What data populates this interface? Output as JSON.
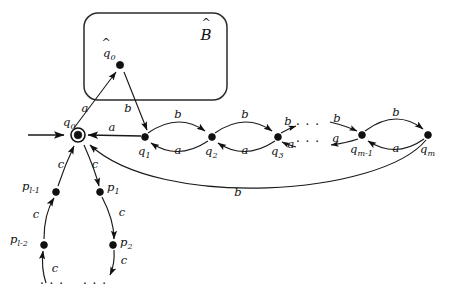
{
  "figure": {
    "kind": "finite-automaton-state-diagram",
    "background_color": "#ffffff",
    "ink_color": "#111111"
  },
  "box": {
    "label": "B",
    "label_accent": "hat",
    "label_style": "calligraphic",
    "x": 84,
    "y": 13,
    "width": 143,
    "height": 87,
    "corner_radius": 14
  },
  "states": {
    "q_hat_0": {
      "label": "q",
      "subscript": "0",
      "accent": "hat",
      "x": 120,
      "y": 65,
      "shape": "dot",
      "label_dx": -12,
      "label_dy": -10
    },
    "q0": {
      "label": "q",
      "subscript": "0",
      "accent": "none",
      "x": 78,
      "y": 135,
      "shape": "double-circle",
      "label_dx": -13,
      "label_dy": -12
    },
    "q1": {
      "label": "q",
      "subscript": "1",
      "accent": "none",
      "x": 145,
      "y": 137,
      "shape": "dot",
      "label_dx": -4,
      "label_dy": 16
    },
    "q2": {
      "label": "q",
      "subscript": "2",
      "accent": "none",
      "x": 212,
      "y": 137,
      "shape": "dot",
      "label_dx": -4,
      "label_dy": 16
    },
    "q3": {
      "label": "q",
      "subscript": "3",
      "accent": "none",
      "x": 278,
      "y": 137,
      "shape": "dot",
      "label_dx": -4,
      "label_dy": 16
    },
    "qm1": {
      "label": "q",
      "subscript": "m-1",
      "accent": "none",
      "x": 362,
      "y": 135,
      "shape": "dot",
      "label_dx": -10,
      "label_dy": 16
    },
    "qm": {
      "label": "q",
      "subscript": "m",
      "accent": "none",
      "x": 428,
      "y": 135,
      "shape": "dot",
      "label_dx": -4,
      "label_dy": 16
    },
    "p1": {
      "label": "p",
      "subscript": "1",
      "accent": "none",
      "x": 100,
      "y": 192,
      "shape": "dot",
      "label_dx": 6,
      "label_dy": 0
    },
    "p2": {
      "label": "p",
      "subscript": "2",
      "accent": "none",
      "x": 113,
      "y": 245,
      "shape": "dot",
      "label_dx": 6,
      "label_dy": 2
    },
    "pl2": {
      "label": "p",
      "subscript": "l-2",
      "accent": "none",
      "x": 44,
      "y": 245,
      "shape": "dot",
      "label_dx": -30,
      "label_dy": -2
    },
    "pl1": {
      "label": "p",
      "subscript": "l-1",
      "accent": "none",
      "x": 56,
      "y": 192,
      "shape": "dot",
      "label_dx": -30,
      "label_dy": -2
    }
  },
  "start_arrow": {
    "from_x": 28,
    "to_x": 66,
    "y": 135,
    "target": "q0"
  },
  "edges": [
    {
      "name": "q0-to-qhat0",
      "from": "q0",
      "to": "q_hat_0",
      "symbol": "a",
      "label_x": 85,
      "label_y": 112
    },
    {
      "name": "qhat0-to-q1",
      "from": "q_hat_0",
      "to": "q1",
      "symbol": "b",
      "label_x": 128,
      "label_y": 112
    },
    {
      "name": "q1-to-q0",
      "from": "q1",
      "to": "q0",
      "symbol": "a",
      "label_x": 112,
      "label_y": 131
    },
    {
      "name": "q1-to-q2",
      "from": "q1",
      "to": "q2",
      "symbol": "b",
      "label_x": 178,
      "label_y": 118
    },
    {
      "name": "q2-to-q1",
      "from": "q2",
      "to": "q1",
      "symbol": "a",
      "label_x": 178,
      "label_y": 152
    },
    {
      "name": "q2-to-q3",
      "from": "q2",
      "to": "q3",
      "symbol": "b",
      "label_x": 245,
      "label_y": 118
    },
    {
      "name": "q3-to-q2",
      "from": "q3",
      "to": "q2",
      "symbol": "a",
      "label_x": 245,
      "label_y": 152
    },
    {
      "name": "q3-to-next",
      "from": "q3",
      "to": "ellipsis",
      "symbol": "b",
      "label_x": 289,
      "label_y": 126
    },
    {
      "name": "next-to-q3",
      "from": "ellipsis",
      "to": "q3",
      "symbol": "a",
      "label_x": 292,
      "label_y": 146
    },
    {
      "name": "prev-to-qm1",
      "from": "ellipsis",
      "to": "qm1",
      "symbol": "b",
      "label_x": 337,
      "label_y": 124
    },
    {
      "name": "qm1-to-prev",
      "from": "qm1",
      "to": "ellipsis",
      "symbol": "a",
      "label_x": 335,
      "label_y": 143
    },
    {
      "name": "qm1-to-qm",
      "from": "qm1",
      "to": "qm",
      "symbol": "b",
      "label_x": 396,
      "label_y": 116
    },
    {
      "name": "qm-to-qm1",
      "from": "qm",
      "to": "qm1",
      "symbol": "a",
      "label_x": 396,
      "label_y": 150
    },
    {
      "name": "qm-to-q0",
      "from": "qm",
      "to": "q0",
      "symbol": "b",
      "label_x": 238,
      "label_y": 193
    },
    {
      "name": "q0-to-p1",
      "from": "q0",
      "to": "p1",
      "symbol": "c",
      "label_x": 95,
      "label_y": 167
    },
    {
      "name": "p1-to-p2",
      "from": "p1",
      "to": "p2",
      "symbol": "c",
      "label_x": 120,
      "label_y": 215
    },
    {
      "name": "p2-to-cycle",
      "from": "p2",
      "to": "ellipsis",
      "symbol": "c",
      "label_x": 122,
      "label_y": 263
    },
    {
      "name": "cycle-to-pl2",
      "from": "ellipsis",
      "to": "pl2",
      "symbol": "c",
      "label_x": 52,
      "label_y": 270
    },
    {
      "name": "pl2-to-pl1",
      "from": "pl2",
      "to": "pl1",
      "symbol": "c",
      "label_x": 38,
      "label_y": 217
    },
    {
      "name": "pl1-to-q0",
      "from": "pl1",
      "to": "q0",
      "symbol": "c",
      "label_x": 62,
      "label_y": 167
    }
  ],
  "ellipses": [
    {
      "name": "chain-ellipsis-upper",
      "text": "· · ·",
      "x": 308,
      "y": 126
    },
    {
      "name": "chain-ellipsis-lower",
      "text": "· · ·",
      "x": 308,
      "y": 143
    },
    {
      "name": "cycle-ellipsis-left",
      "text": "· · ·",
      "x": 52,
      "y": 285
    },
    {
      "name": "cycle-ellipsis-right",
      "text": "· · ·",
      "x": 93,
      "y": 285
    }
  ],
  "alphabet": [
    "a",
    "b",
    "c"
  ]
}
